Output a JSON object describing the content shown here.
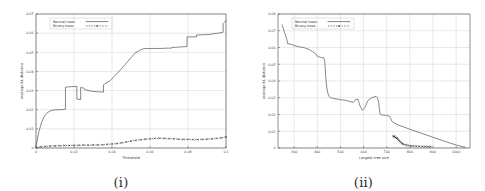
{
  "figure": {
    "panels": [
      {
        "caption": "(i)",
        "legend": {
          "position": "top-left-inside",
          "entries": [
            {
              "label": "Normal trees",
              "style": "solid-line"
            },
            {
              "label": "Binary trees",
              "style": "dashed-line-with-points"
            }
          ]
        },
        "chart_data": {
          "type": "line",
          "title": "",
          "xlabel": "Threshold",
          "ylabel": "average KL distance",
          "xlim": [
            0,
            0.1
          ],
          "ylim": [
            0,
            0.07
          ],
          "xticks": [
            "0",
            "0.02",
            "0.04",
            "0.06",
            "0.08",
            "0.1"
          ],
          "xtick_values": [
            0,
            0.02,
            0.04,
            0.06,
            0.08,
            0.1
          ],
          "yticks": [
            "0",
            "0.01",
            "0.02",
            "0.03",
            "0.04",
            "0.05",
            "0.06",
            "0.07"
          ],
          "ytick_values": [
            0,
            0.01,
            0.02,
            0.03,
            0.04,
            0.05,
            0.06,
            0.07
          ],
          "grid": true,
          "legend_position": "upper left",
          "series": [
            {
              "name": "Normal trees",
              "x": [
                0,
                0.0015,
                0.003,
                0.0045,
                0.006,
                0.008,
                0.01,
                0.012,
                0.0145,
                0.0155,
                0.0155,
                0.018,
                0.021,
                0.0215,
                0.0215,
                0.0235,
                0.0235,
                0.025,
                0.0255,
                0.0255,
                0.029,
                0.032,
                0.0355,
                0.0355,
                0.039,
                0.042,
                0.0455,
                0.049,
                0.052,
                0.0545,
                0.0565,
                0.0565,
                0.062,
                0.0665,
                0.0665,
                0.0715,
                0.0715,
                0.0765,
                0.0795,
                0.0795,
                0.0845,
                0.0845,
                0.089,
                0.0925,
                0.0925,
                0.096,
                0.0985,
                0.0985,
                0.1
              ],
              "y": [
                0.0008,
                0.0085,
                0.0135,
                0.0168,
                0.0185,
                0.0196,
                0.0199,
                0.02,
                0.0201,
                0.0203,
                0.0318,
                0.032,
                0.0321,
                0.0322,
                0.0256,
                0.0252,
                0.0316,
                0.0313,
                0.031,
                0.0305,
                0.0297,
                0.0294,
                0.0292,
                0.033,
                0.0352,
                0.0382,
                0.042,
                0.046,
                0.0495,
                0.051,
                0.0518,
                0.0519,
                0.052,
                0.052,
                0.0521,
                0.0522,
                0.0525,
                0.0528,
                0.053,
                0.058,
                0.0581,
                0.059,
                0.0592,
                0.0594,
                0.0596,
                0.06,
                0.0605,
                0.065,
                0.0665
              ]
            },
            {
              "name": "Binary trees",
              "x": [
                0,
                0.0025,
                0.005,
                0.0075,
                0.01,
                0.0125,
                0.015,
                0.0175,
                0.02,
                0.0225,
                0.025,
                0.0275,
                0.03,
                0.0325,
                0.035,
                0.0375,
                0.04,
                0.0425,
                0.045,
                0.0475,
                0.05,
                0.0525,
                0.055,
                0.0575,
                0.06,
                0.0625,
                0.065,
                0.0675,
                0.07,
                0.0725,
                0.075,
                0.0775,
                0.08,
                0.0825,
                0.085,
                0.0875,
                0.09,
                0.0925,
                0.095,
                0.0975,
                0.1
              ],
              "y": [
                0.0002,
                0.0006,
                0.0008,
                0.001,
                0.0011,
                0.0012,
                0.0013,
                0.0013,
                0.0014,
                0.0014,
                0.0015,
                0.0015,
                0.0016,
                0.0016,
                0.0017,
                0.0019,
                0.0021,
                0.0023,
                0.0027,
                0.0031,
                0.0036,
                0.004,
                0.0043,
                0.0046,
                0.0048,
                0.005,
                0.0051,
                0.005,
                0.0049,
                0.0048,
                0.0046,
                0.0045,
                0.0045,
                0.0044,
                0.0044,
                0.0045,
                0.0046,
                0.0048,
                0.005,
                0.0053,
                0.0058
              ]
            }
          ]
        }
      },
      {
        "caption": "(ii)",
        "legend": {
          "position": "top-left-inside",
          "entries": [
            {
              "label": "Normal trees",
              "style": "solid-line"
            },
            {
              "label": "Binary trees",
              "style": "dashed-line-with-points"
            }
          ]
        },
        "chart_data": {
          "type": "line",
          "title": "",
          "xlabel": "Largest tree size",
          "ylabel": "average KL distance",
          "xlim": [
            230,
            1060
          ],
          "ylim": [
            0,
            0.08
          ],
          "xticks": [
            "300",
            "400",
            "500",
            "600",
            "700",
            "800",
            "900",
            "1000"
          ],
          "xtick_values": [
            300,
            400,
            500,
            600,
            700,
            800,
            900,
            1000
          ],
          "yticks": [
            "0",
            "0.01",
            "0.02",
            "0.03",
            "0.04",
            "0.05",
            "0.06",
            "0.07",
            "0.08"
          ],
          "ytick_values": [
            0,
            0.01,
            0.02,
            0.03,
            0.04,
            0.05,
            0.06,
            0.07,
            0.08
          ],
          "grid": true,
          "legend_position": "upper left",
          "series": [
            {
              "name": "Normal trees",
              "x": [
                248,
                258,
                268,
                272,
                285,
                300,
                320,
                345,
                365,
                380,
                395,
                400,
                405,
                418,
                428,
                432,
                436,
                440,
                445,
                450,
                455,
                462,
                470,
                485,
                500,
                520,
                540,
                555,
                565,
                575,
                585,
                595,
                605,
                612,
                618,
                625,
                635,
                645,
                655,
                660,
                665,
                670,
                672,
                678,
                690,
                700,
                705,
                712,
                718,
                722,
                730,
                745,
                760,
                800,
                850,
                900,
                950,
                1000,
                1040
              ],
              "y": [
                0.0735,
                0.069,
                0.065,
                0.0622,
                0.062,
                0.0612,
                0.0605,
                0.0598,
                0.0588,
                0.0575,
                0.056,
                0.0548,
                0.0545,
                0.054,
                0.0538,
                0.052,
                0.043,
                0.037,
                0.033,
                0.031,
                0.0302,
                0.0298,
                0.0296,
                0.0292,
                0.0288,
                0.0285,
                0.0278,
                0.0272,
                0.0288,
                0.0292,
                0.025,
                0.0225,
                0.024,
                0.0262,
                0.028,
                0.0292,
                0.03,
                0.0305,
                0.0308,
                0.03,
                0.027,
                0.0215,
                0.02,
                0.0198,
                0.0196,
                0.0194,
                0.0192,
                0.019,
                0.0175,
                0.016,
                0.0152,
                0.014,
                0.0132,
                0.0112,
                0.0088,
                0.0064,
                0.004,
                0.0018,
                0.0004
              ]
            },
            {
              "name": "Binary trees",
              "x": [
                728,
                732,
                735,
                738,
                742,
                745,
                748,
                752,
                756,
                760,
                765,
                770,
                778,
                786,
                795,
                805,
                815,
                828,
                840,
                855,
                868,
                880,
                890
              ],
              "y": [
                0.0072,
                0.0066,
                0.007,
                0.0062,
                0.0058,
                0.006,
                0.0052,
                0.0046,
                0.004,
                0.0034,
                0.0028,
                0.0024,
                0.002,
                0.0017,
                0.0015,
                0.0013,
                0.0012,
                0.0011,
                0.001,
                0.0009,
                0.0009,
                0.0008,
                0.0008
              ]
            }
          ]
        }
      }
    ]
  }
}
